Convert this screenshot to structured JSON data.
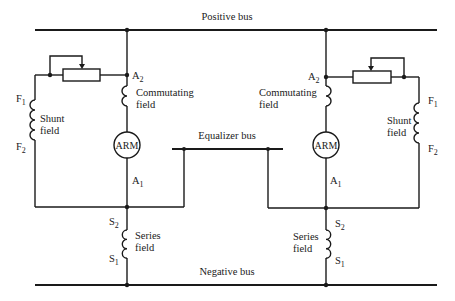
{
  "labels": {
    "positive_bus": "Positive bus",
    "negative_bus": "Negative bus",
    "equalizer_bus": "Equalizer bus"
  },
  "left_generator": {
    "armature": "ARM",
    "a2": "A",
    "a2_sub": "2",
    "a1": "A",
    "a1_sub": "1",
    "commutating_line1": "Commutating",
    "commutating_line2": "field",
    "shunt_line1": "Shunt",
    "shunt_line2": "field",
    "f1": "F",
    "f1_sub": "1",
    "f2": "F",
    "f2_sub": "2",
    "series_line1": "Series",
    "series_line2": "field",
    "s2": "S",
    "s2_sub": "2",
    "s1": "S",
    "s1_sub": "1"
  },
  "right_generator": {
    "armature": "ARM",
    "a2": "A",
    "a2_sub": "2",
    "a1": "A",
    "a1_sub": "1",
    "commutating_line1": "Commutating",
    "commutating_line2": "field",
    "shunt_line1": "Shunt",
    "shunt_line2": "field",
    "f1": "F",
    "f1_sub": "1",
    "f2": "F",
    "f2_sub": "2",
    "series_line1": "Series",
    "series_line2": "field",
    "s2": "S",
    "s2_sub": "2",
    "s1": "S",
    "s1_sub": "1"
  }
}
